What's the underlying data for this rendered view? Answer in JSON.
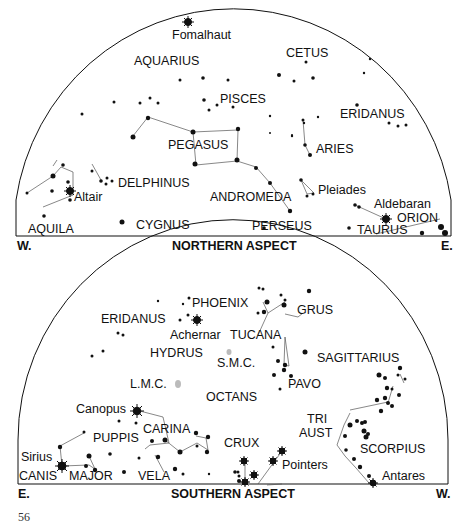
{
  "northern": {
    "title": "NORTHERN ASPECT",
    "west": "W.",
    "east": "E.",
    "constellations": [
      "AQUARIUS",
      "CETUS",
      "PISCES",
      "ERIDANUS",
      "PEGASUS",
      "ARIES",
      "DELPHINUS",
      "ANDROMEDA",
      "AQUILA",
      "CYGNUS",
      "PERSEUS",
      "TAURUS",
      "ORION"
    ],
    "stars": [
      "Fomalhaut",
      "Altair",
      "Pleiades",
      "Aldebaran"
    ]
  },
  "southern": {
    "title": "SOUTHERN ASPECT",
    "west": "W.",
    "east": "E.",
    "constellations": [
      "ERIDANUS",
      "PHOENIX",
      "GRUS",
      "TUCANA",
      "HYDRUS",
      "S.M.C.",
      "SAGITTARIUS",
      "L.M.C.",
      "PAVO",
      "OCTANS",
      "TRI",
      "AUST",
      "CARINA",
      "PUPPIS",
      "CRUX",
      "SCORPIUS",
      "CANIS",
      "MAJOR",
      "VELA"
    ],
    "stars": [
      "Achernar",
      "Canopus",
      "Sirius",
      "Pointers",
      "Antares"
    ]
  },
  "page_number": "56"
}
